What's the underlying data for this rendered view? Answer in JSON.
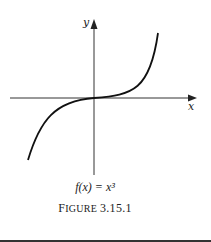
{
  "figure": {
    "y_axis_label": "y",
    "x_axis_label": "x",
    "function_label": "f(x) = x³",
    "caption_first": "F",
    "caption_rest": "IGURE",
    "caption_number": "3.15.1"
  }
}
